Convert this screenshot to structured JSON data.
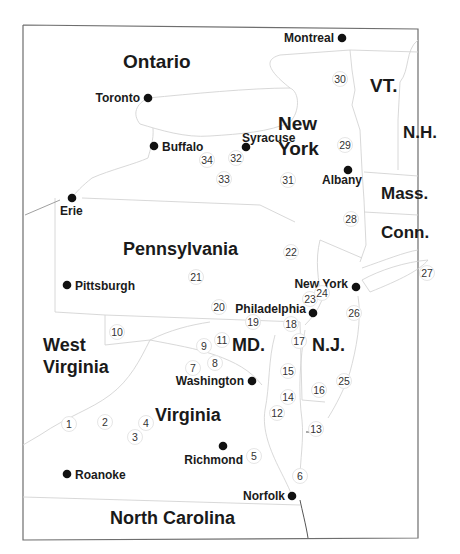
{
  "map": {
    "regions": [
      {
        "id": "ontario",
        "label": "Ontario",
        "x": 123,
        "y": 68,
        "size": 19
      },
      {
        "id": "new-york-state-1",
        "label": "New",
        "x": 278,
        "y": 130,
        "size": 19
      },
      {
        "id": "new-york-state-2",
        "label": "York",
        "x": 278,
        "y": 155,
        "size": 19
      },
      {
        "id": "vt",
        "label": "VT.",
        "x": 370,
        "y": 92,
        "size": 19
      },
      {
        "id": "nh",
        "label": "N.H.",
        "x": 403,
        "y": 138,
        "size": 17
      },
      {
        "id": "mass",
        "label": "Mass.",
        "x": 381,
        "y": 199,
        "size": 17
      },
      {
        "id": "conn",
        "label": "Conn.",
        "x": 381,
        "y": 238,
        "size": 17
      },
      {
        "id": "pennsylvania",
        "label": "Pennsylvania",
        "x": 123,
        "y": 255,
        "size": 18
      },
      {
        "id": "west-virginia-1",
        "label": "West",
        "x": 43,
        "y": 351,
        "size": 18
      },
      {
        "id": "west-virginia-2",
        "label": "Virginia",
        "x": 43,
        "y": 373,
        "size": 18
      },
      {
        "id": "md",
        "label": "MD.",
        "x": 232,
        "y": 351,
        "size": 18
      },
      {
        "id": "nj",
        "label": "N.J.",
        "x": 312,
        "y": 351,
        "size": 18
      },
      {
        "id": "virginia",
        "label": "Virginia",
        "x": 155,
        "y": 421,
        "size": 18
      },
      {
        "id": "north-carolina",
        "label": "North Carolina",
        "x": 110,
        "y": 524,
        "size": 18
      }
    ],
    "cities": [
      {
        "id": "montreal",
        "label": "Montreal",
        "dot_x": 342,
        "dot_y": 38,
        "label_x": 334,
        "label_y": 42,
        "anchor": "end"
      },
      {
        "id": "toronto",
        "label": "Toronto",
        "dot_x": 148,
        "dot_y": 98,
        "label_x": 140,
        "label_y": 102,
        "anchor": "end"
      },
      {
        "id": "buffalo",
        "label": "Buffalo",
        "dot_x": 154,
        "dot_y": 146,
        "label_x": 162,
        "label_y": 151,
        "anchor": "start"
      },
      {
        "id": "syracuse",
        "label": "Syracuse",
        "dot_x": 246,
        "dot_y": 147,
        "label_x": 242,
        "label_y": 142,
        "anchor": "start"
      },
      {
        "id": "albany",
        "label": "Albany",
        "dot_x": 348,
        "dot_y": 170,
        "label_x": 362,
        "label_y": 184,
        "anchor": "end"
      },
      {
        "id": "erie",
        "label": "Erie",
        "dot_x": 72,
        "dot_y": 198,
        "label_x": 60,
        "label_y": 215,
        "anchor": "start"
      },
      {
        "id": "pittsburgh",
        "label": "Pittsburgh",
        "dot_x": 67,
        "dot_y": 285,
        "label_x": 75,
        "label_y": 290,
        "anchor": "start"
      },
      {
        "id": "new-york-city",
        "label": "New York",
        "dot_x": 356,
        "dot_y": 287,
        "label_x": 348,
        "label_y": 288,
        "anchor": "end"
      },
      {
        "id": "philadelphia",
        "label": "Philadelphia",
        "dot_x": 313,
        "dot_y": 313,
        "label_x": 306,
        "label_y": 313,
        "anchor": "end"
      },
      {
        "id": "washington",
        "label": "Washington",
        "dot_x": 252,
        "dot_y": 381,
        "label_x": 244,
        "label_y": 385,
        "anchor": "end"
      },
      {
        "id": "richmond",
        "label": "Richmond",
        "dot_x": 223,
        "dot_y": 446,
        "label_x": 243,
        "label_y": 464,
        "anchor": "end"
      },
      {
        "id": "roanoke",
        "label": "Roanoke",
        "dot_x": 67,
        "dot_y": 474,
        "label_x": 75,
        "label_y": 479,
        "anchor": "start"
      },
      {
        "id": "norfolk",
        "label": "Norfolk",
        "dot_x": 292,
        "dot_y": 496,
        "label_x": 285,
        "label_y": 500,
        "anchor": "end"
      }
    ],
    "markers": [
      {
        "n": "1",
        "x": 69,
        "y": 424
      },
      {
        "n": "2",
        "x": 105,
        "y": 422
      },
      {
        "n": "3",
        "x": 135,
        "y": 437
      },
      {
        "n": "4",
        "x": 146,
        "y": 423
      },
      {
        "n": "5",
        "x": 254,
        "y": 456
      },
      {
        "n": "6",
        "x": 300,
        "y": 476
      },
      {
        "n": "7",
        "x": 193,
        "y": 368
      },
      {
        "n": "8",
        "x": 215,
        "y": 363
      },
      {
        "n": "9",
        "x": 204,
        "y": 346
      },
      {
        "n": "10",
        "x": 117,
        "y": 332
      },
      {
        "n": "11",
        "x": 222,
        "y": 340
      },
      {
        "n": "12",
        "x": 277,
        "y": 413
      },
      {
        "n": "13",
        "x": 316,
        "y": 429
      },
      {
        "n": "14",
        "x": 288,
        "y": 397
      },
      {
        "n": "15",
        "x": 288,
        "y": 371
      },
      {
        "n": "16",
        "x": 319,
        "y": 390
      },
      {
        "n": "17",
        "x": 299,
        "y": 341
      },
      {
        "n": "18",
        "x": 291,
        "y": 324
      },
      {
        "n": "19",
        "x": 253,
        "y": 322
      },
      {
        "n": "20",
        "x": 219,
        "y": 307
      },
      {
        "n": "21",
        "x": 196,
        "y": 277
      },
      {
        "n": "22",
        "x": 291,
        "y": 252
      },
      {
        "n": "23",
        "x": 310,
        "y": 299
      },
      {
        "n": "24",
        "x": 322,
        "y": 293
      },
      {
        "n": "25",
        "x": 344,
        "y": 381
      },
      {
        "n": "26",
        "x": 354,
        "y": 313
      },
      {
        "n": "27",
        "x": 427,
        "y": 273
      },
      {
        "n": "28",
        "x": 351,
        "y": 219
      },
      {
        "n": "29",
        "x": 345,
        "y": 145
      },
      {
        "n": "30",
        "x": 340,
        "y": 79
      },
      {
        "n": "31",
        "x": 288,
        "y": 180
      },
      {
        "n": "32",
        "x": 236,
        "y": 158
      },
      {
        "n": "33",
        "x": 224,
        "y": 179
      },
      {
        "n": "34",
        "x": 207,
        "y": 160
      }
    ]
  }
}
